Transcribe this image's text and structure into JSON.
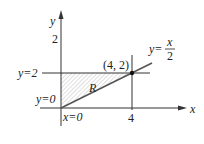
{
  "diagram": {
    "axes": {
      "x_label": "x",
      "y_label": "y",
      "x_tick": "4",
      "y_tick": "2"
    },
    "lines": {
      "y2_label": "y=2",
      "y0_label": "y=0",
      "x0_label": "x=0",
      "diag_label_lhs": "y=",
      "diag_label_num": "x",
      "diag_label_den": "2"
    },
    "point_label": "(4, 2)",
    "region_label": "R",
    "colors": {
      "line": "#333333",
      "hatch": "#aaaaaa"
    }
  }
}
